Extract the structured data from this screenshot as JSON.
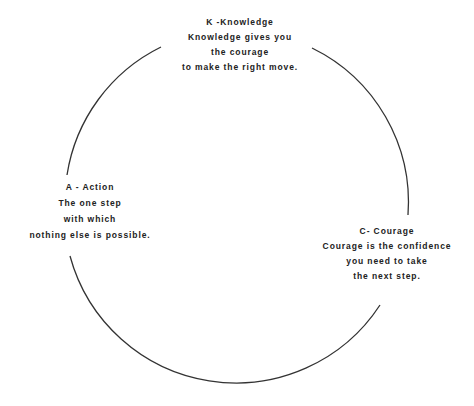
{
  "diagram": {
    "stroke_color": "#333333",
    "text_color": "#222222",
    "nodes": [
      {
        "id": "k",
        "heading": "K -Knowledge",
        "lines": [
          "Knowledge gives you",
          "the courage",
          "to make the right move."
        ]
      },
      {
        "id": "a",
        "heading": "A - Action",
        "lines": [
          "The one step",
          "with which",
          "nothing else is possible."
        ]
      },
      {
        "id": "c",
        "heading": "C- Courage",
        "lines": [
          "Courage is the confidence",
          "you need to take",
          "the next step."
        ]
      }
    ],
    "arcs": [
      {
        "from": "a",
        "to": "k"
      },
      {
        "from": "k",
        "to": "c"
      },
      {
        "from": "c",
        "to": "a"
      }
    ]
  }
}
